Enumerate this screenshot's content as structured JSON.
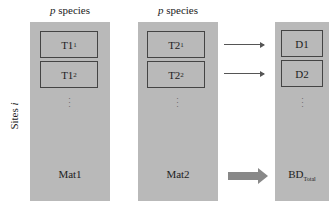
{
  "columns": [
    {
      "header_var": "p",
      "header_text": " species",
      "boxes": [
        {
          "label": "T1",
          "sub": "1"
        },
        {
          "label": "T1",
          "sub": "2"
        }
      ],
      "ellipsis": "⋮",
      "bottom_label": "Mat1",
      "bottom_sub": ""
    },
    {
      "header_var": "p",
      "header_text": " species",
      "boxes": [
        {
          "label": "T2",
          "sub": "1"
        },
        {
          "label": "T2",
          "sub": "2"
        }
      ],
      "ellipsis": "⋮",
      "bottom_label": "Mat2",
      "bottom_sub": ""
    },
    {
      "header_var": "",
      "header_text": "",
      "boxes": [
        {
          "label": "D1",
          "sub": ""
        },
        {
          "label": "D2",
          "sub": ""
        }
      ],
      "ellipsis": "⋮",
      "bottom_label": "BD",
      "bottom_sub": "Total"
    }
  ],
  "row_axis": {
    "text": "Sites ",
    "var": "i"
  },
  "colors": {
    "column_fill": "#b9b9b9",
    "border": "#444444",
    "arrow": "#888888"
  }
}
